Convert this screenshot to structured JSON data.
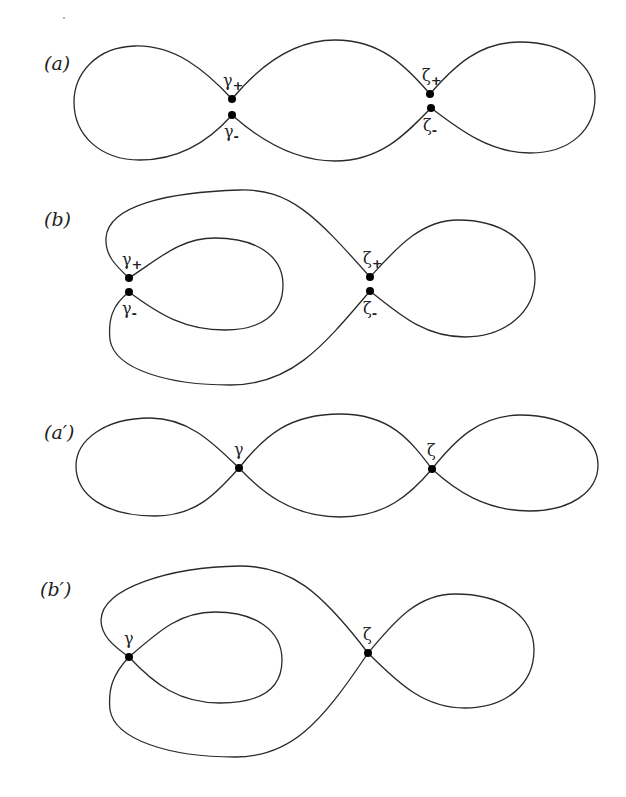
{
  "figure": {
    "panels": [
      {
        "id": "a",
        "label": "(a)",
        "nodes": [
          {
            "symbol": "γ",
            "sub": "+",
            "position": "top"
          },
          {
            "symbol": "γ",
            "sub": "-",
            "position": "bottom"
          },
          {
            "symbol": "ζ",
            "sub": "+",
            "position": "top"
          },
          {
            "symbol": "ζ",
            "sub": "-",
            "position": "bottom"
          }
        ]
      },
      {
        "id": "b",
        "label": "(b)",
        "nodes": [
          {
            "symbol": "γ",
            "sub": "+",
            "position": "top"
          },
          {
            "symbol": "γ",
            "sub": "-",
            "position": "bottom"
          },
          {
            "symbol": "ζ",
            "sub": "+",
            "position": "top"
          },
          {
            "symbol": "ζ",
            "sub": "-",
            "position": "bottom"
          }
        ]
      },
      {
        "id": "a-prime",
        "label": "(a′)",
        "nodes": [
          {
            "symbol": "γ"
          },
          {
            "symbol": "ζ"
          }
        ]
      },
      {
        "id": "b-prime",
        "label": "(b′)",
        "nodes": [
          {
            "symbol": "γ"
          },
          {
            "symbol": "ζ"
          }
        ]
      }
    ],
    "colors": {
      "stroke": "#2a2a2a",
      "node": "#000000",
      "background": "#ffffff"
    }
  }
}
